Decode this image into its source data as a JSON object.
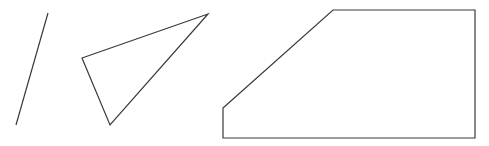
{
  "canvas": {
    "width": 489,
    "height": 146,
    "background": "#ffffff",
    "stroke_color": "#3a3a3a"
  },
  "shapes": [
    {
      "type": "line",
      "name": "slanted-line",
      "points": [
        [
          48,
          13
        ],
        [
          16,
          125
        ]
      ]
    },
    {
      "type": "triangle",
      "name": "triangle",
      "points": [
        [
          82,
          58
        ],
        [
          208,
          14
        ],
        [
          110,
          125
        ]
      ]
    },
    {
      "type": "pentagon",
      "name": "pentagon-chamfered-rectangle",
      "points": [
        [
          223,
          108
        ],
        [
          333,
          10
        ],
        [
          475,
          10
        ],
        [
          475,
          138
        ],
        [
          223,
          138
        ]
      ]
    }
  ]
}
